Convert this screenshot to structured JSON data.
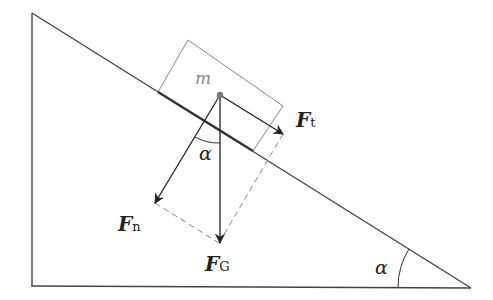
{
  "diagram": {
    "type": "inclined-plane-force-decomposition",
    "labels": {
      "mass": "m",
      "angle_at_mass": "α",
      "angle_at_base": "α",
      "force_tangential": {
        "main": "F",
        "sub": "t"
      },
      "force_normal": {
        "main": "F",
        "sub": "n"
      },
      "force_gravity": {
        "main": "F",
        "sub": "G"
      }
    },
    "colors": {
      "line": "#333333",
      "block": "#888888",
      "dashed": "#888888",
      "mass_label": "#888888",
      "text": "#222222"
    }
  }
}
